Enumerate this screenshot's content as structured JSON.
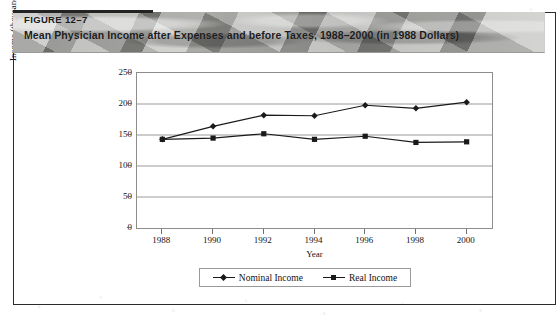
{
  "figure": {
    "number": "FIGURE 12–7",
    "caption": "Mean Physician Income after Expenses and before Taxes, 1988–2000 (in 1988 Dollars)"
  },
  "legend": {
    "items": [
      {
        "label": "Nominal Income",
        "marker": "diamond-marker-icon",
        "color": "#1a1a1a"
      },
      {
        "label": "Real Income",
        "marker": "square-marker-icon",
        "color": "#1a1a1a"
      }
    ]
  },
  "axes": {
    "y_ticks": [
      "250",
      "200",
      "150",
      "100",
      "50",
      "0"
    ],
    "x_ticks": [
      "1988",
      "1990",
      "1992",
      "1994",
      "1996",
      "1998",
      "2000"
    ],
    "y_title": "Income (thousands of dollars)",
    "x_title": "Year"
  },
  "chart_data": {
    "type": "line",
    "title": "Mean Physician Income after Expenses and before Taxes, 1988–2000 (in 1988 Dollars)",
    "xlabel": "Year",
    "ylabel": "Income (thousands of dollars)",
    "x": [
      1988,
      1990,
      1992,
      1994,
      1996,
      1998,
      2000
    ],
    "xlim": [
      1987,
      2001
    ],
    "ylim": [
      0,
      250
    ],
    "yticks": [
      0,
      50,
      100,
      150,
      200,
      250
    ],
    "grid": true,
    "legend_position": "bottom-center",
    "series": [
      {
        "name": "Nominal Income",
        "marker": "diamond",
        "color": "#1a1a1a",
        "values": [
          143,
          164,
          182,
          181,
          198,
          193,
          203
        ]
      },
      {
        "name": "Real Income",
        "marker": "square",
        "color": "#1a1a1a",
        "values": [
          143,
          145,
          152,
          143,
          148,
          138,
          139
        ]
      }
    ]
  }
}
